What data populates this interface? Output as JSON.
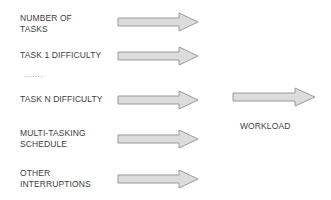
{
  "diagram": {
    "inputs": [
      {
        "label": "NUMBER OF\nTASKS"
      },
      {
        "label": "TASK 1 DIFFICULTY"
      },
      {
        "label": "TASK N DIFFICULTY"
      },
      {
        "label": "MULTI-TASKING\nSCHEDULE"
      },
      {
        "label": "OTHER\nINTERRUPTIONS"
      }
    ],
    "ellipsis": ".......",
    "output": {
      "label": "WORKLOAD"
    },
    "colors": {
      "arrow_fill": "#dcdcdc",
      "arrow_stroke": "#9a9a9a",
      "text": "#404040"
    }
  }
}
